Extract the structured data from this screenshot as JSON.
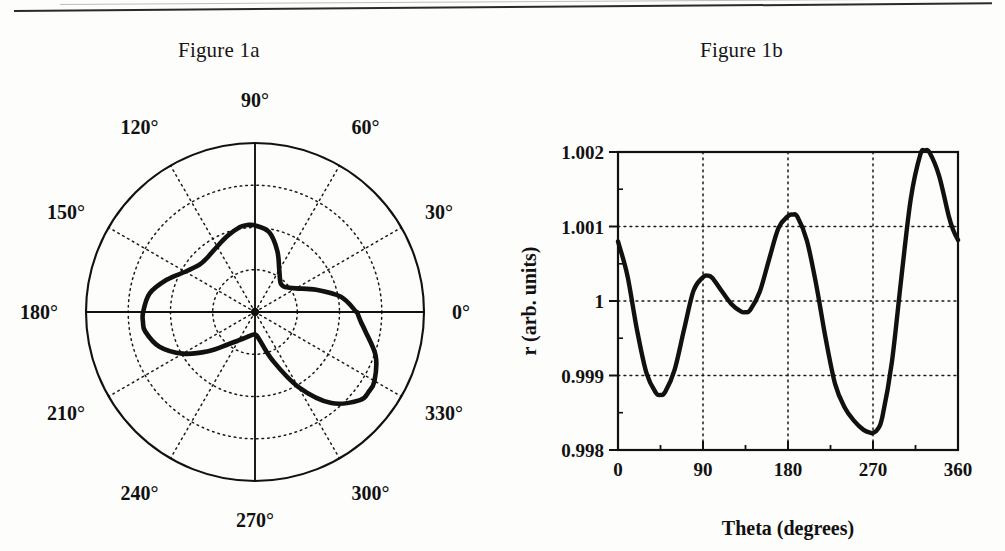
{
  "page": {
    "figure_a_title": "Figure 1a",
    "figure_b_title": "Figure 1b"
  },
  "figure_a": {
    "type": "polar",
    "angle_labels": [
      "0°",
      "30°",
      "60°",
      "90°",
      "120°",
      "150°",
      "180°",
      "210°",
      "240°",
      "270°",
      "300°",
      "330°"
    ],
    "angle_values": [
      0,
      30,
      60,
      90,
      120,
      150,
      180,
      210,
      240,
      270,
      300,
      330
    ],
    "radial_rings": 4,
    "outer_ring_solid": true
  },
  "figure_b": {
    "xlabel": "Theta (degrees)",
    "ylabel": "r (arb. units)",
    "xticks": [
      "0",
      "90",
      "180",
      "270",
      "360"
    ],
    "yticks": [
      "0.998",
      "0.999",
      "1",
      "1.001",
      "1.002"
    ]
  },
  "chart_data": {
    "type": "line",
    "title": "Figure 1b",
    "xlabel": "Theta (degrees)",
    "ylabel": "r (arb. units)",
    "xlim": [
      0,
      360
    ],
    "ylim": [
      0.998,
      1.002
    ],
    "xticks": [
      0,
      90,
      180,
      270,
      360
    ],
    "yticks": [
      0.998,
      0.999,
      1.0,
      1.001,
      1.002
    ],
    "grid": true,
    "legend": null,
    "series": [
      {
        "name": "r(theta)",
        "x": [
          0,
          10,
          20,
          30,
          40,
          45,
          50,
          60,
          70,
          80,
          90,
          95,
          100,
          110,
          120,
          130,
          135,
          140,
          150,
          160,
          170,
          180,
          185,
          190,
          200,
          210,
          220,
          230,
          240,
          250,
          260,
          268,
          270,
          275,
          280,
          290,
          300,
          310,
          320,
          325,
          330,
          340,
          350,
          355,
          360
        ],
        "y": [
          1.0008,
          1.00034,
          0.99962,
          0.99904,
          0.99877,
          0.99874,
          0.99878,
          0.99908,
          0.99962,
          1.00014,
          1.00032,
          1.00034,
          1.00031,
          1.00013,
          0.99996,
          0.99986,
          0.99985,
          0.99988,
          1.00012,
          1.00056,
          1.00098,
          1.00114,
          1.00116,
          1.00113,
          1.00081,
          1.00021,
          0.99949,
          0.99888,
          0.99857,
          0.99839,
          0.99827,
          0.99823,
          0.99823,
          0.99828,
          0.99845,
          0.99918,
          1.00031,
          1.00137,
          1.00196,
          1.00202,
          1.00199,
          1.00168,
          1.00115,
          1.00095,
          1.00082
        ]
      }
    ],
    "annotations": [
      {
        "feature": "minimum",
        "x": 45,
        "y": 0.99874
      },
      {
        "feature": "local maximum",
        "x": 95,
        "y": 1.00034
      },
      {
        "feature": "local minimum",
        "x": 135,
        "y": 0.99985
      },
      {
        "feature": "local maximum",
        "x": 185,
        "y": 1.00116
      },
      {
        "feature": "global minimum",
        "x": 270,
        "y": 0.99823
      },
      {
        "feature": "global maximum",
        "x": 325,
        "y": 1.00202
      }
    ]
  },
  "polar_data": {
    "type": "line",
    "coordinate_system": "polar",
    "theta": [
      0,
      10,
      20,
      30,
      40,
      45,
      50,
      60,
      70,
      80,
      90,
      95,
      100,
      110,
      120,
      130,
      135,
      140,
      150,
      160,
      170,
      180,
      185,
      190,
      200,
      210,
      220,
      230,
      240,
      250,
      260,
      268,
      270,
      275,
      280,
      290,
      300,
      310,
      320,
      325,
      330,
      340,
      350,
      355,
      360
    ],
    "r": [
      1.0008,
      1.00034,
      0.99962,
      0.99904,
      0.99877,
      0.99874,
      0.99878,
      0.99908,
      0.99962,
      1.00014,
      1.00032,
      1.00034,
      1.00031,
      1.00013,
      0.99996,
      0.99986,
      0.99985,
      0.99988,
      1.00012,
      1.00056,
      1.00098,
      1.00114,
      1.00116,
      1.00113,
      1.00081,
      1.00021,
      0.99949,
      0.99888,
      0.99857,
      0.99839,
      0.99827,
      0.99823,
      0.99823,
      0.99828,
      0.99845,
      0.99918,
      1.00031,
      1.00137,
      1.00196,
      1.00202,
      1.00199,
      1.00168,
      1.00115,
      1.00095,
      1.00082
    ],
    "rlim": [
      0.9975,
      1.003
    ]
  },
  "colors": {
    "ink": "#111111",
    "grid": "#1a1a1a",
    "paper": "#fdfdfc"
  }
}
